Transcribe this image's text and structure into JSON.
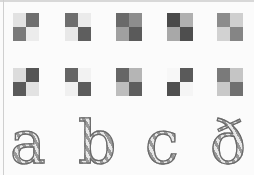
{
  "drawing": {
    "description": "Pencil sketch of checkered 2x2 squares and decorative letters",
    "rows": [
      {
        "squares": [
          {
            "cells": [
              "#e2e2e2",
              "#6f6f6f",
              "#7a7a7a",
              "#ececec"
            ],
            "x": 13,
            "y": 13
          },
          {
            "cells": [
              "#6e6e6e",
              "#ebebeb",
              "#e8e8e8",
              "#5e5e5e"
            ],
            "x": 65,
            "y": 13
          },
          {
            "cells": [
              "#6a6a6a",
              "#8d8d8d",
              "#a0a0a0",
              "#5a5a5a"
            ],
            "x": 116,
            "y": 13
          },
          {
            "cells": [
              "#4a4a4a",
              "#b0b0b0",
              "#a8a8a8",
              "#4e4e4e"
            ],
            "x": 167,
            "y": 13
          },
          {
            "cells": [
              "#8c8c8c",
              "#cfcfcf",
              "#d2d2d2",
              "#858585"
            ],
            "x": 217,
            "y": 13
          }
        ]
      },
      {
        "squares": [
          {
            "cells": [
              "#dcdcdc",
              "#555555",
              "#5a5a5a",
              "#e2e2e2"
            ],
            "x": 13,
            "y": 68
          },
          {
            "cells": [
              "#656565",
              "#f2f2f2",
              "#f0f0f0",
              "#5c5c5c"
            ],
            "x": 65,
            "y": 68
          },
          {
            "cells": [
              "#666666",
              "#b5b5b5",
              "#bdbdbd",
              "#5e5e5e"
            ],
            "x": 116,
            "y": 68
          },
          {
            "cells": [
              "#f7f7f7",
              "#5a5a5a",
              "#4f4f4f",
              "#f5f5f5"
            ],
            "x": 167,
            "y": 68
          },
          {
            "cells": [
              "#7a7a7a",
              "#c5c5c5",
              "#c8c8c8",
              "#707070"
            ],
            "x": 217,
            "y": 68
          }
        ]
      }
    ],
    "letters": [
      {
        "char": "a",
        "x": 10
      },
      {
        "char": "b",
        "x": 78
      },
      {
        "char": "c",
        "x": 145
      },
      {
        "char": "ð",
        "x": 210
      }
    ]
  }
}
